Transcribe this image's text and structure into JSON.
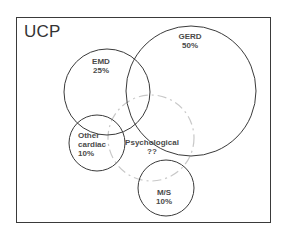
{
  "diagram": {
    "title": "UCP",
    "type": "venn",
    "sets": [
      {
        "id": "gerd",
        "name": "GERD",
        "value": "50%",
        "style": "solid"
      },
      {
        "id": "emd",
        "name": "EMD",
        "value": "25%",
        "style": "solid"
      },
      {
        "id": "other_cardiac",
        "name": "Other cardiac",
        "name_line1": "Other",
        "name_line2": "cardiac",
        "value": "10%",
        "style": "solid"
      },
      {
        "id": "psychological",
        "name": "Psychological",
        "value": "??",
        "style": "dashed"
      },
      {
        "id": "ms",
        "name": "M/S",
        "value": "10%",
        "style": "solid"
      }
    ],
    "colors": {
      "circle": "#3a3a3a",
      "dashed_circle": "#c8c8c8",
      "text": "#4a4a4a",
      "frame": "#3a3a3a"
    }
  }
}
